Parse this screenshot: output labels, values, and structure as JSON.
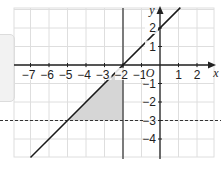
{
  "figure": {
    "type": "coordinate-grid-graph",
    "axes": {
      "x_label": "x",
      "y_label": "y",
      "origin_label": "O",
      "x_ticks": [
        {
          "value": -7,
          "label": "−7"
        },
        {
          "value": -6,
          "label": "−6"
        },
        {
          "value": -5,
          "label": "−5"
        },
        {
          "value": -4,
          "label": "−4"
        },
        {
          "value": -3,
          "label": "−3"
        },
        {
          "value": -2,
          "label": "−2"
        },
        {
          "value": -1,
          "label": "−1"
        },
        {
          "value": 1,
          "label": "1"
        },
        {
          "value": 2,
          "label": "2"
        }
      ],
      "y_ticks": [
        {
          "value": 2,
          "label": "2"
        },
        {
          "value": 1,
          "label": "1"
        },
        {
          "value": -1,
          "label": "−1"
        },
        {
          "value": -2,
          "label": "−2"
        },
        {
          "value": -3,
          "label": "−3"
        },
        {
          "value": -4,
          "label": "−4"
        }
      ],
      "x_range": [
        -7.8,
        2.9
      ],
      "y_range": [
        -5,
        3.1
      ]
    },
    "lines": [
      {
        "name": "y = x + 2",
        "style": "solid",
        "color": "#1a1a1a"
      },
      {
        "name": "x = -2",
        "style": "solid",
        "color": "#555555"
      },
      {
        "name": "y = -3",
        "style": "dashed",
        "color": "#333333"
      }
    ],
    "shaded_region": {
      "vertices": [
        [
          -5,
          -3
        ],
        [
          -2,
          -3
        ],
        [
          -2,
          0
        ]
      ],
      "color": "#d6d6d6"
    },
    "colors": {
      "grid": "#dedede",
      "axis": "#222222",
      "background": "#ffffff"
    }
  }
}
